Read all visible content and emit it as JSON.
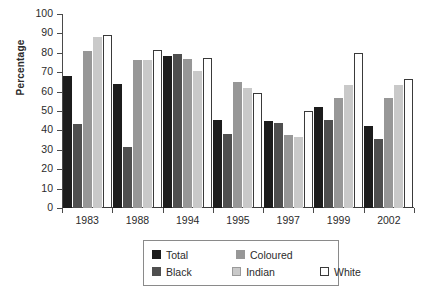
{
  "chart_data": {
    "type": "bar",
    "title": "",
    "subtitle": "",
    "xlabel": "",
    "ylabel": "Percentage",
    "ylim": [
      0,
      100
    ],
    "ytick_step": 10,
    "yticks": [
      100,
      90,
      80,
      70,
      60,
      50,
      40,
      30,
      20,
      10,
      0
    ],
    "grid": false,
    "legend_position": "bottom",
    "categories": [
      "1983",
      "1988",
      "1994",
      "1995",
      "1997",
      "1999",
      "2002"
    ],
    "series": [
      {
        "name": "Total",
        "color": "#1c1c1c",
        "values": [
          68,
          64,
          78.5,
          45.5,
          45,
          52,
          42.5
        ]
      },
      {
        "name": "Black",
        "color": "#4f4f4f",
        "values": [
          43.5,
          31.5,
          79.5,
          38,
          44,
          45.5,
          35.5
        ]
      },
      {
        "name": "Coloured",
        "color": "#979797",
        "values": [
          81,
          76.5,
          77,
          65,
          37.5,
          56.5,
          56.5
        ]
      },
      {
        "name": "Indian",
        "color": "#c9c9c9",
        "values": [
          88,
          76.5,
          70.5,
          62,
          36.5,
          63.5,
          63.5
        ]
      },
      {
        "name": "White",
        "color": "#ffffff",
        "values": [
          89,
          81.5,
          77.5,
          59.5,
          50,
          80,
          66.5
        ]
      }
    ]
  },
  "legend": {
    "rows": [
      [
        {
          "name": "Total",
          "swatch": "s-total"
        },
        {
          "name": "Coloured",
          "swatch": "s-coloured"
        }
      ],
      [
        {
          "name": "Black",
          "swatch": "s-black"
        },
        {
          "name": "Indian",
          "swatch": "s-indian"
        },
        {
          "name": "White",
          "swatch": "s-white"
        }
      ]
    ]
  }
}
